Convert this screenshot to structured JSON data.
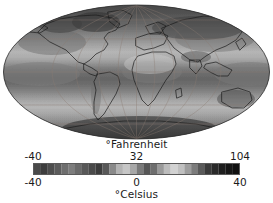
{
  "figure": {
    "kind": "world-temperature-map",
    "projection": "mollweide"
  },
  "map": {
    "name": "global-surface-temperature-map",
    "graticule": {
      "meridian_spacing_deg": 30,
      "parallel_spacing_deg": 30,
      "visible": true
    }
  },
  "legend": {
    "fahrenheit": {
      "title": "°Fahrenheit",
      "ticks": [
        {
          "label": "-40",
          "pos": 0
        },
        {
          "label": "32",
          "pos": 50
        },
        {
          "label": "104",
          "pos": 100
        }
      ]
    },
    "celsius": {
      "title": "°Celsius",
      "ticks": [
        {
          "label": "-40",
          "pos": 0
        },
        {
          "label": "0",
          "pos": 50
        },
        {
          "label": "40",
          "pos": 100
        }
      ]
    },
    "colorbar": {
      "name": "temperature-colorbar",
      "orientation": "horizontal",
      "colormap": "grayscale-banded",
      "stops": [
        "#4a4a4a",
        "#3e3e3e",
        "#4e4e4e",
        "#5c5c5c",
        "#6e6e6e",
        "#7d7d7d",
        "#6a6a6a",
        "#585858",
        "#4a4a4a",
        "#3c3c3c",
        "#585858",
        "#8a8a8a",
        "#b4b4b4",
        "#c6c6c6",
        "#a8a8a8",
        "#7a7a7a",
        "#565656",
        "#6e6e6e",
        "#9a9a9a",
        "#bcbcbc",
        "#d2d2d2",
        "#c0c0c0",
        "#9e9e9e",
        "#7c7c7c",
        "#5a5a5a",
        "#3a3a3a",
        "#2a2a2a",
        "#1e1e1e",
        "#161616",
        "#101010"
      ]
    }
  },
  "chart_data": {
    "type": "heatmap",
    "title": "",
    "xlabel": "",
    "ylabel": "",
    "projection": "mollweide",
    "variable": "surface air temperature",
    "units_primary": "°Fahrenheit",
    "units_secondary": "°Celsius",
    "colorbar_label_primary": "°Fahrenheit",
    "colorbar_label_secondary": "°Celsius",
    "fahrenheit_ticks": [
      -40,
      32,
      104
    ],
    "celsius_ticks": [
      -40,
      0,
      40
    ],
    "fahrenheit_range": [
      -40,
      104
    ],
    "celsius_range": [
      -40,
      40
    ],
    "colormap": "grayscale",
    "grid": true,
    "legend_position": "below",
    "regions": [
      {
        "name": "equatorial-belt",
        "celsius_approx": 27
      },
      {
        "name": "tropics",
        "celsius_approx": 24
      },
      {
        "name": "mid-latitudes",
        "celsius_approx": 12
      },
      {
        "name": "high-latitudes",
        "celsius_approx": -5
      },
      {
        "name": "arctic",
        "celsius_approx": -25
      },
      {
        "name": "antarctic",
        "celsius_approx": -35
      }
    ]
  }
}
